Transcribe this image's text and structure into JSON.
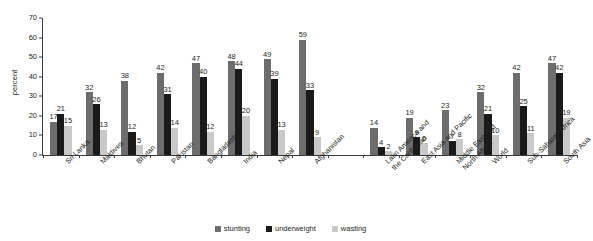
{
  "chart_data": {
    "type": "bar",
    "title": "",
    "xlabel": "",
    "ylabel": "percent",
    "ylim": [
      0,
      70
    ],
    "yticks": [
      0,
      10,
      20,
      30,
      40,
      50,
      60,
      70
    ],
    "grid": false,
    "legend_position": "bottom",
    "categories": [
      "Sri Lanka",
      "Maldives",
      "Bhutan",
      "Pakistan",
      "Bangladesh",
      "India",
      "Nepal",
      "Afghanistan",
      "",
      "Latin America and\nthe Caribbean",
      "East Asia and Pacific",
      "Middle East and\nNorth Africa",
      "World",
      "Sub-Saharan Africa",
      "South Asia"
    ],
    "series": [
      {
        "name": "stunting",
        "color": "#6d6d6d",
        "values": [
          17,
          32,
          38,
          42,
          47,
          48,
          49,
          59,
          null,
          14,
          19,
          23,
          32,
          42,
          47
        ]
      },
      {
        "name": "underweight",
        "color": "#1a1a1a",
        "values": [
          21,
          26,
          12,
          31,
          40,
          44,
          39,
          33,
          null,
          4,
          9,
          7,
          21,
          25,
          42
        ]
      },
      {
        "name": "wasting",
        "color": "#c9c9c9",
        "values": [
          15,
          13,
          5,
          14,
          12,
          20,
          13,
          9,
          null,
          2,
          6,
          8,
          10,
          11,
          19
        ]
      }
    ]
  },
  "legend": {
    "items": [
      {
        "label": "stunting"
      },
      {
        "label": "underweight"
      },
      {
        "label": "wasting"
      }
    ]
  },
  "axis": {
    "y_label": "percent"
  }
}
